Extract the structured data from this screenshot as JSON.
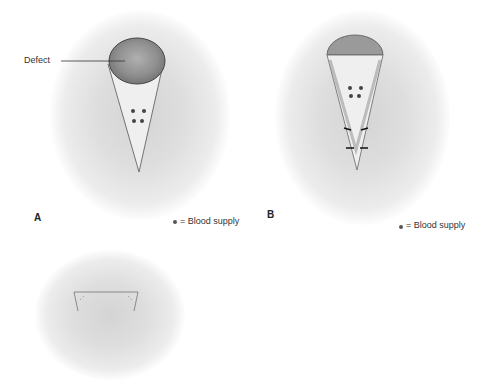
{
  "panels": [
    {
      "letter": "A",
      "legend": "= Blood supply",
      "callout": "Defect"
    },
    {
      "letter": "B",
      "legend": "= Blood supply"
    },
    {
      "letter": "C"
    }
  ],
  "colors": {
    "shadow": "#d8d8d8",
    "defect": "#8a8a8a",
    "outline": "#555555",
    "dot": "#444444"
  }
}
